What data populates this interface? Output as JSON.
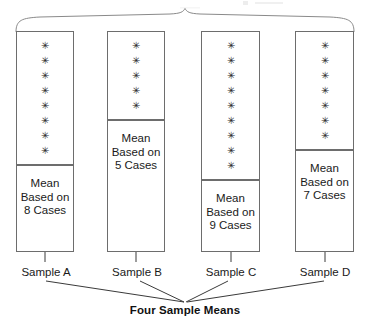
{
  "figure": {
    "bottom_caption": "Four Sample Means",
    "top_brace_name": "population-brace",
    "asterisk_glyph": "✳"
  },
  "samples": [
    {
      "id": "a",
      "name": "Sample A",
      "case_count": 8,
      "mean_label": "Mean\nBased on\n8 Cases",
      "asterisks": [
        "✳",
        "✳",
        "✳",
        "✳",
        "✳",
        "✳",
        "✳",
        "✳"
      ]
    },
    {
      "id": "b",
      "name": "Sample B",
      "case_count": 5,
      "mean_label": "Mean\nBased on\n5 Cases",
      "asterisks": [
        "✳",
        "✳",
        "✳",
        "✳",
        "✳"
      ]
    },
    {
      "id": "c",
      "name": "Sample C",
      "case_count": 9,
      "mean_label": "Mean\nBased on\n9 Cases",
      "asterisks": [
        "✳",
        "✳",
        "✳",
        "✳",
        "✳",
        "✳",
        "✳",
        "✳",
        "✳"
      ]
    },
    {
      "id": "d",
      "name": "Sample D",
      "case_count": 7,
      "mean_label": "Mean\nBased on\n7 Cases",
      "asterisks": [
        "✳",
        "✳",
        "✳",
        "✳",
        "✳",
        "✳",
        "✳"
      ]
    }
  ],
  "colors": {
    "box_stroke": "#6d6d6d",
    "line_stroke": "#3a3a3a",
    "brace_stroke": "#8a8a8a",
    "text": "#1a1a1a",
    "background": "#ffffff"
  }
}
